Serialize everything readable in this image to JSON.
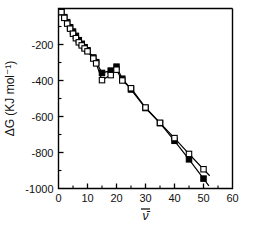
{
  "chart_data": {
    "type": "scatter",
    "title": "",
    "xlabel": "ν̄",
    "ylabel": "ΔG  (KJ mol⁻¹)",
    "xlim": [
      0,
      60
    ],
    "ylim": [
      -1000,
      0
    ],
    "xticks": [
      0,
      10,
      20,
      30,
      40,
      50,
      60
    ],
    "xticklabels": [
      "0",
      "10",
      "20",
      "30",
      "40",
      "50",
      "60"
    ],
    "xminorticks": [
      5,
      15,
      25,
      35,
      45,
      55
    ],
    "yticks": [
      -1000,
      -800,
      -600,
      -400,
      -200
    ],
    "yticklabels": [
      "-1000",
      "-800",
      "-600",
      "-400",
      "-200"
    ],
    "yminorticks": [
      -900,
      -700,
      -500,
      -300,
      -100
    ],
    "grid": false,
    "legend": "none",
    "series": [
      {
        "name": "filled-squares",
        "marker": "filled-square",
        "color": "#000000",
        "points": [
          [
            1,
            -20
          ],
          [
            2,
            -48
          ],
          [
            3,
            -76
          ],
          [
            4,
            -104
          ],
          [
            5,
            -128
          ],
          [
            6,
            -152
          ],
          [
            7,
            -176
          ],
          [
            8,
            -196
          ],
          [
            9,
            -215
          ],
          [
            10,
            -232
          ],
          [
            12,
            -272
          ],
          [
            13,
            -298
          ],
          [
            15,
            -358
          ],
          [
            18,
            -345
          ],
          [
            20,
            -323
          ],
          [
            22,
            -390
          ],
          [
            25,
            -450
          ],
          [
            30,
            -553
          ],
          [
            35,
            -637
          ],
          [
            40,
            -735
          ],
          [
            45,
            -838
          ],
          [
            50,
            -945
          ]
        ]
      },
      {
        "name": "open-squares",
        "marker": "open-square",
        "color": "#000000",
        "points": [
          [
            1,
            -20
          ],
          [
            2,
            -52
          ],
          [
            3,
            -84
          ],
          [
            4,
            -112
          ],
          [
            5,
            -140
          ],
          [
            6,
            -165
          ],
          [
            7,
            -188
          ],
          [
            8,
            -205
          ],
          [
            9,
            -222
          ],
          [
            10,
            -238
          ],
          [
            12,
            -278
          ],
          [
            13,
            -305
          ],
          [
            15,
            -398
          ],
          [
            18,
            -370
          ],
          [
            20,
            -340
          ],
          [
            22,
            -400
          ],
          [
            25,
            -443
          ],
          [
            30,
            -550
          ],
          [
            35,
            -635
          ],
          [
            40,
            -720
          ],
          [
            45,
            -808
          ],
          [
            50,
            -893
          ]
        ]
      }
    ]
  }
}
